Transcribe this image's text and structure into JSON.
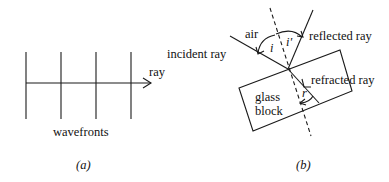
{
  "panel_a": {
    "ray_label": "ray",
    "wavefronts_label": "wavefronts",
    "caption": "(a)",
    "wavefront_x": [
      26,
      61,
      96,
      131
    ],
    "wavefront_y_range": [
      52,
      119
    ],
    "ray_y": 83,
    "ray_x_range": [
      26,
      150
    ]
  },
  "panel_b": {
    "air_label": "air",
    "incident_ray_label": "incident ray",
    "reflected_ray_label": "reflected ray",
    "refracted_ray_label": "refracted ray",
    "glass_label_line1": "glass",
    "glass_label_line2": "block",
    "angle_i_label": "i",
    "angle_i_prime_label": "i'",
    "angle_r_label": "r",
    "caption": "(b)"
  }
}
